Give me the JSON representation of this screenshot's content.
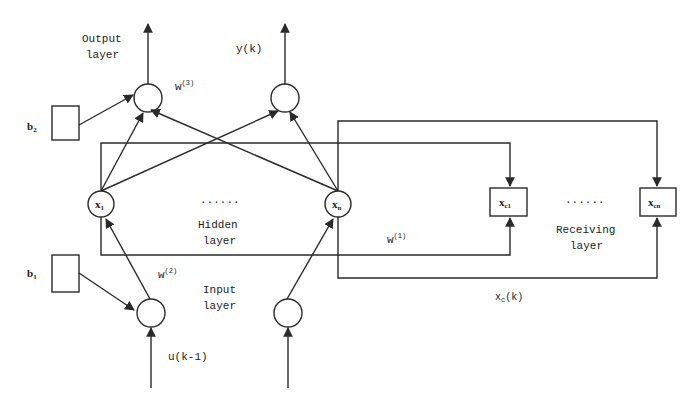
{
  "diagram": {
    "layers": {
      "output": {
        "label_line1": "Output",
        "label_line2": "layer"
      },
      "hidden": {
        "label_line1": "Hidden",
        "label_line2": "layer"
      },
      "input": {
        "label_line1": "Input",
        "label_line2": "layer"
      },
      "receiving": {
        "label_line1": "Receiving",
        "label_line2": "layer"
      }
    },
    "nodes": {
      "hidden_first": {
        "base": "x",
        "sub": "1"
      },
      "hidden_last": {
        "base": "x",
        "sub": "n"
      },
      "context_first": {
        "base": "x",
        "sub": "c1"
      },
      "context_last": {
        "base": "x",
        "sub": "cn"
      },
      "ellipsis": "......"
    },
    "bias": {
      "output": {
        "base": "b",
        "sub": "2"
      },
      "input": {
        "base": "b",
        "sub": "1"
      }
    },
    "weights": {
      "w1": {
        "base": "w",
        "sup": "(1)"
      },
      "w2": {
        "base": "w",
        "sup": "(2)"
      },
      "w3": {
        "base": "w",
        "sup": "(3)"
      }
    },
    "signals": {
      "output": "y(k)",
      "input": "u(k-1)",
      "context": {
        "base": "x",
        "sub": "c",
        "rest": "(k)"
      }
    },
    "colors": {
      "stroke": "#2a2a2a",
      "background": "#ffffff",
      "ghost_text": "#efefef"
    }
  }
}
